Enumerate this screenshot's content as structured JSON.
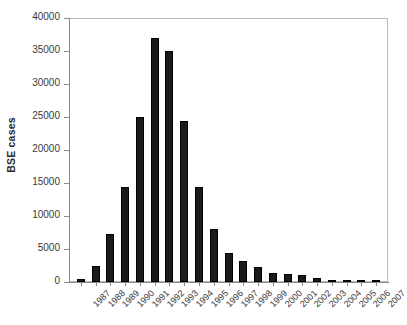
{
  "chart_data": {
    "type": "bar",
    "title": "",
    "xlabel": "",
    "ylabel": "BSE cases",
    "ylim": [
      0,
      40000
    ],
    "grid": false,
    "legend": "none",
    "bar_color": "#1b1b1b",
    "categories": [
      "1987",
      "1988",
      "1989",
      "1990",
      "1991",
      "1992",
      "1993",
      "1994",
      "1995",
      "1996",
      "1997",
      "1998",
      "1999",
      "2000",
      "2001",
      "2002",
      "2003",
      "2004",
      "2005",
      "2006",
      "2007"
    ],
    "values": [
      440,
      2500,
      7200,
      14400,
      25000,
      37000,
      35000,
      24400,
      14400,
      8100,
      4400,
      3200,
      2300,
      1400,
      1200,
      1100,
      600,
      350,
      230,
      110,
      60
    ],
    "yticks": [
      0,
      5000,
      10000,
      15000,
      20000,
      25000,
      30000,
      35000,
      40000
    ],
    "ytick_labels": [
      "0",
      "5000",
      "10000",
      "15000",
      "20000",
      "25000",
      "30000",
      "35000",
      "40000"
    ]
  }
}
